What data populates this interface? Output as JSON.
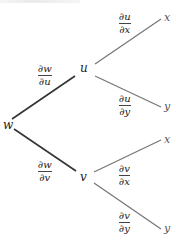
{
  "diagram": {
    "root": {
      "label": "w"
    },
    "intermediate": [
      {
        "label": "u",
        "edge_num": "∂w",
        "edge_den": "∂u"
      },
      {
        "label": "v",
        "edge_num": "∂w",
        "edge_den": "∂v"
      }
    ],
    "leaves": [
      {
        "label": "x",
        "parent": "u",
        "edge_num": "∂u",
        "edge_den": "∂x"
      },
      {
        "label": "y",
        "parent": "u",
        "edge_num": "∂u",
        "edge_den": "∂y"
      },
      {
        "label": "x",
        "parent": "v",
        "edge_num": "∂v",
        "edge_den": "∂x"
      },
      {
        "label": "y",
        "parent": "v",
        "edge_num": "∂v",
        "edge_den": "∂y"
      }
    ],
    "colors": {
      "trunk_edge": "#333333",
      "branch_edge": "#777777",
      "text": "#222222"
    }
  }
}
